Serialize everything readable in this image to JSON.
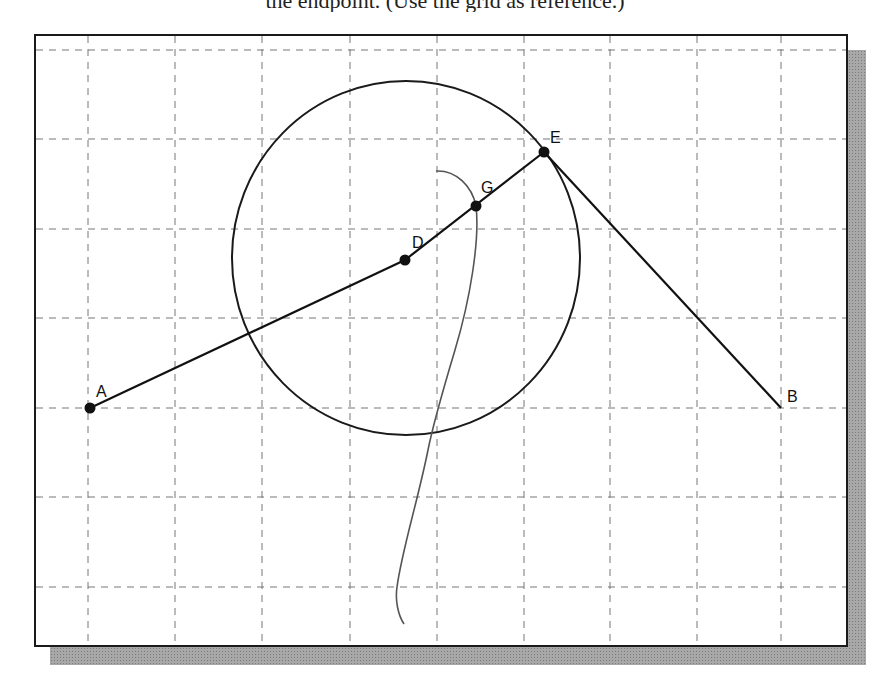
{
  "header": {
    "clipped_text": "the endpoint. (Use the grid as reference.)"
  },
  "drawing": {
    "frame": {
      "x": 34,
      "y": 34,
      "width": 814,
      "height": 613,
      "stroke": "#1a1a1a"
    },
    "shadow_color": "#a8a8a8",
    "grid": {
      "color": "#777777",
      "vertical_x": [
        88,
        175,
        262,
        350,
        437,
        524,
        610,
        697,
        781
      ],
      "horizontal_y": [
        50,
        139,
        229,
        318,
        408,
        497,
        587
      ]
    },
    "points": [
      {
        "id": "A",
        "label": "A",
        "x": 90,
        "y": 408,
        "dot": true,
        "label_x": 96,
        "label_y": 397
      },
      {
        "id": "D",
        "label": "D",
        "x": 405,
        "y": 260,
        "dot": true,
        "label_x": 412,
        "label_y": 248
      },
      {
        "id": "G",
        "label": "G",
        "x": 476,
        "y": 206,
        "dot": true,
        "label_x": 481,
        "label_y": 193
      },
      {
        "id": "E",
        "label": "E",
        "x": 544,
        "y": 152,
        "dot": true,
        "label_x": 550,
        "label_y": 143
      },
      {
        "id": "B",
        "label": "B",
        "x": 781,
        "y": 408,
        "dot": false,
        "label_x": 787,
        "label_y": 402
      }
    ],
    "segments": [
      {
        "from": "A",
        "to": "D"
      },
      {
        "from": "D",
        "to": "E"
      },
      {
        "from": "E",
        "to": "B"
      }
    ],
    "circle": {
      "cx": 406,
      "cy": 258,
      "rx": 174,
      "ry": 177
    },
    "curve": {
      "color": "#555555",
      "path": "M 436 171 C 456 170, 472 186, 476 206 C 480 240, 470 300, 455 350 C 440 400, 432 430, 428 450 C 418 500, 402 550, 397 587 C 395 600, 398 615, 404 624"
    }
  }
}
